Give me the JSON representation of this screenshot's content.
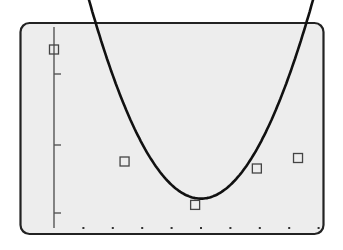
{
  "chart_data": {
    "type": "scatter",
    "title": "",
    "xlabel": "",
    "ylabel": "",
    "grid": false,
    "legend": null,
    "x_tick_count": 9,
    "x_tick_style": "dots",
    "y_ticks": [
      1,
      2,
      3
    ],
    "xlim": [
      -1.15,
      9.1
    ],
    "ylim": [
      0,
      3.1
    ],
    "series": [
      {
        "name": "data points",
        "type": "scatter",
        "marker": "open-square",
        "x": [
          0.0,
          2.4,
          4.8,
          6.9,
          8.3
        ],
        "y": [
          2.55,
          0.95,
          0.33,
          0.85,
          1.0
        ]
      },
      {
        "name": "quadratic fit",
        "type": "line",
        "x_start": -0.65,
        "x_end": 9.0,
        "vertex_x": 5.0,
        "vertex_y": 0.42,
        "a": 0.085
      }
    ]
  },
  "style": {
    "frame_color": "#222222",
    "plot_bg": "#ededed",
    "curve_color": "#111111",
    "marker_color": "#444444"
  }
}
